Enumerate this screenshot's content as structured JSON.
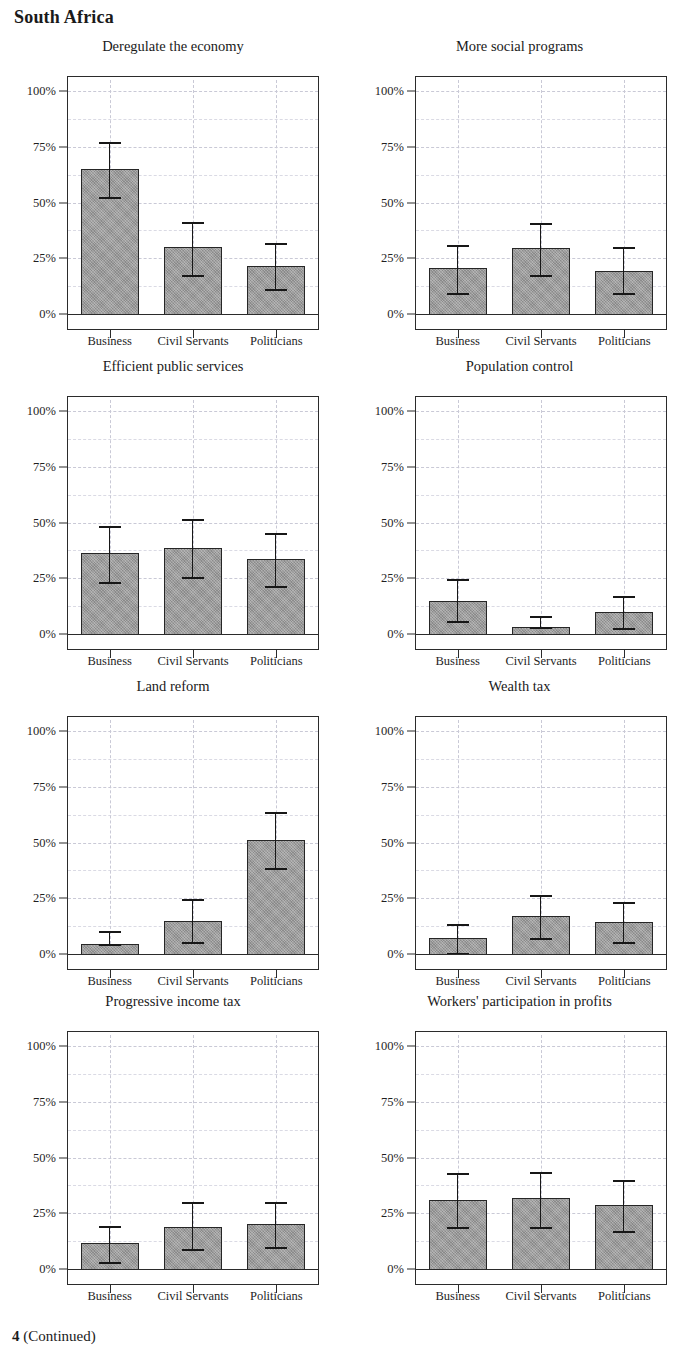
{
  "page": {
    "title": "South Africa",
    "caption_number": "4",
    "caption_continued": "(Continued)",
    "caption_full": "4 (Continued)"
  },
  "axis": {
    "y_ticks": [
      "0%",
      "25%",
      "50%",
      "75%",
      "100%"
    ],
    "y_tick_values": [
      0,
      25,
      50,
      75,
      100
    ],
    "y_minor_values": [
      12.5,
      37.5,
      62.5,
      87.5
    ],
    "ylim": [
      0,
      105
    ],
    "x_categories": [
      "Business",
      "Civil Servants",
      "Politicians"
    ]
  },
  "style": {
    "bar_fill": "#9d9d9d",
    "bar_stroke": "#262626",
    "error_color": "#171717",
    "grid_color": "#c9c9d6",
    "frame_color": "#2b2b2b",
    "text_color": "#1a1a1a"
  },
  "chart_data": {
    "type": "bar",
    "title": "South Africa",
    "xlabel": "",
    "ylabel": "",
    "ylim": [
      0,
      105
    ],
    "grid": true,
    "legend": "none",
    "categories": [
      "Business",
      "Civil Servants",
      "Politicians"
    ],
    "error_bars": "95% confidence interval",
    "units": "percent",
    "panels": [
      {
        "title": "Deregulate the economy",
        "values": [
          65,
          30,
          21.5
        ],
        "ci_low": [
          52.5,
          17.5,
          11
        ],
        "ci_high": [
          77,
          41.5,
          32
        ]
      },
      {
        "title": "More social programs",
        "values": [
          20.5,
          29.5,
          19.5
        ],
        "ci_low": [
          9.5,
          17.5,
          9.5
        ],
        "ci_high": [
          31,
          41,
          30
        ]
      },
      {
        "title": "Efficient public services",
        "values": [
          36.5,
          38.5,
          33.5
        ],
        "ci_low": [
          23.5,
          25.5,
          21.5
        ],
        "ci_high": [
          48.5,
          51.5,
          45.5
        ]
      },
      {
        "title": "Population control",
        "values": [
          15,
          3,
          10
        ],
        "ci_low": [
          6,
          3,
          2.5
        ],
        "ci_high": [
          24.5,
          8,
          17
        ]
      },
      {
        "title": "Land reform",
        "values": [
          4.5,
          15,
          51
        ],
        "ci_low": [
          4.5,
          5.5,
          38.5
        ],
        "ci_high": [
          10.5,
          24.5,
          63.5
        ]
      },
      {
        "title": "Wealth tax",
        "values": [
          7,
          17,
          14.5
        ],
        "ci_low": [
          0.5,
          7,
          5.5
        ],
        "ci_high": [
          13.5,
          26.5,
          23.5
        ]
      },
      {
        "title": "Progressive income tax",
        "values": [
          11.5,
          19,
          20
        ],
        "ci_low": [
          3,
          9,
          10
        ],
        "ci_high": [
          19.5,
          30,
          30
        ]
      },
      {
        "title": "Workers' participation in profits",
        "values": [
          31,
          32,
          28.5
        ],
        "ci_low": [
          19,
          19,
          17
        ],
        "ci_high": [
          43,
          43.5,
          40
        ]
      }
    ]
  }
}
